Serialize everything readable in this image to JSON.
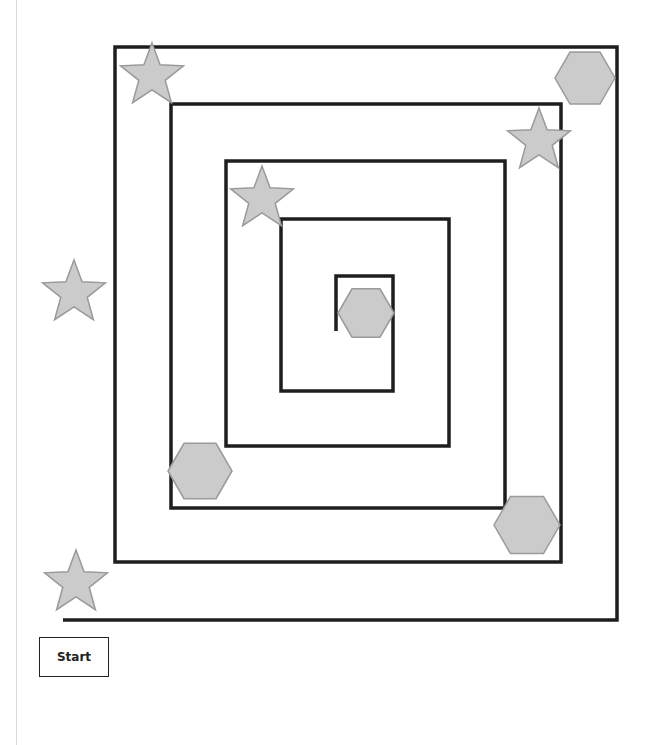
{
  "start_label": "Start",
  "colors": {
    "wall": "#1e1e1e",
    "shape_fill": "#cbcbcb",
    "shape_stroke": "#9a9a9a"
  },
  "maze": {
    "type": "square-spiral",
    "path": [
      [
        63,
        620
      ],
      [
        617,
        620
      ],
      [
        617,
        47
      ],
      [
        115,
        47
      ],
      [
        115,
        562
      ],
      [
        561,
        562
      ],
      [
        561,
        104
      ],
      [
        171,
        104
      ],
      [
        171,
        508
      ],
      [
        505,
        508
      ],
      [
        505,
        161
      ],
      [
        226,
        161
      ],
      [
        226,
        446
      ],
      [
        449,
        446
      ],
      [
        449,
        219
      ],
      [
        281,
        219
      ],
      [
        281,
        391
      ],
      [
        393,
        391
      ],
      [
        393,
        276
      ],
      [
        336,
        276
      ],
      [
        336,
        331
      ]
    ]
  },
  "shapes": [
    {
      "kind": "star",
      "cx": 152,
      "cy": 76,
      "r": 33
    },
    {
      "kind": "hexagon",
      "cx": 585,
      "cy": 78,
      "r": 30
    },
    {
      "kind": "star",
      "cx": 539,
      "cy": 141,
      "r": 33
    },
    {
      "kind": "star",
      "cx": 262,
      "cy": 199,
      "r": 33
    },
    {
      "kind": "star",
      "cx": 74,
      "cy": 293,
      "r": 33
    },
    {
      "kind": "hexagon",
      "cx": 366,
      "cy": 313,
      "r": 28
    },
    {
      "kind": "hexagon",
      "cx": 200,
      "cy": 471,
      "r": 32
    },
    {
      "kind": "hexagon",
      "cx": 527,
      "cy": 525,
      "r": 33
    },
    {
      "kind": "star",
      "cx": 76,
      "cy": 583,
      "r": 33
    }
  ]
}
